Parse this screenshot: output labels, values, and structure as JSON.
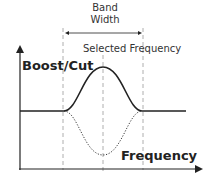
{
  "labels": {
    "band_width_line1": "Band",
    "band_width_line2": "Width",
    "selected_frequency": "Selected Frequency",
    "y_axis": "Boost/Cut",
    "x_axis": "Frequency"
  },
  "colors": {
    "line": "#222222",
    "dashed": "#999999"
  }
}
